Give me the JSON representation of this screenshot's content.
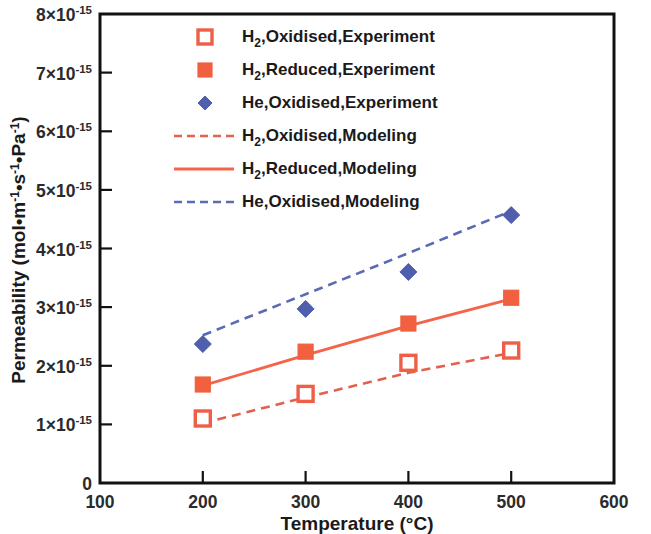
{
  "chart_data": {
    "type": "scatter",
    "title": "",
    "xlabel": "Temperature (°C)",
    "ylabel": "Permeability (mol•m⁻¹•s⁻¹•Pa⁻¹)",
    "xlim": [
      100,
      600
    ],
    "ylim": [
      0,
      8e-15
    ],
    "xticks": [
      100,
      200,
      300,
      400,
      500,
      600
    ],
    "xticklabels": [
      "100",
      "200",
      "300",
      "400",
      "500",
      "600"
    ],
    "yticks": [
      0,
      1e-15,
      2e-15,
      3e-15,
      4e-15,
      5e-15,
      6e-15,
      7e-15,
      8e-15
    ],
    "yticklabels": [
      "0",
      "1×10-15",
      "2×10-15",
      "3×10-15",
      "4×10-15",
      "5×10-15",
      "6×10-15",
      "7×10-15",
      "8×10-15"
    ],
    "grid": false,
    "legend_position": "upper-left-inside",
    "x": [
      200,
      300,
      400,
      500
    ],
    "series": [
      {
        "name": "H2,Oxidised,Experiment",
        "style": "open-square-marker",
        "color": "#ee5f48",
        "values": [
          1.1e-15,
          1.52e-15,
          2.05e-15,
          2.26e-15
        ]
      },
      {
        "name": "H2,Reduced,Experiment",
        "style": "filled-square-marker",
        "color": "#f1603f",
        "values": [
          1.68e-15,
          2.24e-15,
          2.72e-15,
          3.16e-15
        ]
      },
      {
        "name": "He,Oxidised,Experiment",
        "style": "filled-diamond-marker",
        "color": "#4f5fad",
        "values": [
          2.37e-15,
          2.97e-15,
          3.6e-15,
          4.57e-15
        ]
      },
      {
        "name": "H2,Oxidised,Modeling",
        "style": "dashed-line",
        "color": "#e2614d",
        "values": [
          1.02e-15,
          1.46e-15,
          1.88e-15,
          2.22e-15
        ]
      },
      {
        "name": "H2,Reduced,Modeling",
        "style": "solid-line",
        "color": "#f4644a",
        "values": [
          1.66e-15,
          2.18e-15,
          2.68e-15,
          3.14e-15
        ]
      },
      {
        "name": "He,Oxidised,Modeling",
        "style": "dashed-line",
        "color": "#5a6ab4",
        "values": [
          2.52e-15,
          3.22e-15,
          3.92e-15,
          4.64e-15
        ]
      }
    ]
  },
  "axes": {
    "y_title_parts": {
      "main": "Permeability (mol•m",
      "sup1": "-1",
      "mid1": "•s",
      "sup2": "-1",
      "mid2": "•Pa",
      "sup3": "-1",
      "tail": ")"
    },
    "x_title": "Temperature (°C)",
    "y_tick_base": "×10",
    "y_tick_exp": "-15"
  },
  "legend": {
    "items": [
      {
        "key": "legend-h2-oxidised-experiment",
        "marker": "open-square-marker",
        "pre": "H",
        "sub": "2",
        "post": ",Oxidised,Experiment",
        "color": "#ee5f48"
      },
      {
        "key": "legend-h2-reduced-experiment",
        "marker": "filled-square-marker",
        "pre": "H",
        "sub": "2",
        "post": ",Reduced,Experiment",
        "color": "#f1603f"
      },
      {
        "key": "legend-he-oxidised-experiment",
        "marker": "filled-diamond-marker",
        "pre": "He,Oxidised,Experiment",
        "sub": "",
        "post": "",
        "color": "#4f5fad"
      },
      {
        "key": "legend-h2-oxidised-modeling",
        "marker": "dashed-line",
        "pre": "H",
        "sub": "2",
        "post": ",Oxidised,Modeling",
        "color": "#e2614d"
      },
      {
        "key": "legend-h2-reduced-modeling",
        "marker": "solid-line",
        "pre": "H",
        "sub": "2",
        "post": ",Reduced,Modeling",
        "color": "#f4644a"
      },
      {
        "key": "legend-he-oxidised-modeling",
        "marker": "dashed-line",
        "pre": "He,Oxidised,Modeling",
        "sub": "",
        "post": "",
        "color": "#5a6ab4"
      }
    ]
  },
  "colors": {
    "red_open": "#ee5f48",
    "red_fill": "#f1603f",
    "blue": "#4f5fad",
    "blue_line": "#5a6ab4",
    "axis": "#111111",
    "background": "#ffffff"
  }
}
